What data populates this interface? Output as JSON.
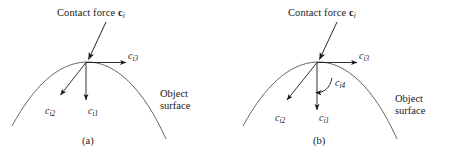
{
  "figure": {
    "background_color": "#ffffff",
    "stroke_color": "#1a1a1a",
    "curve_color": "#4a4a4a",
    "width": 463,
    "height": 159
  },
  "panels": [
    {
      "id": "a",
      "caption": "(a)",
      "title": {
        "prefix": "Contact force ",
        "vector": "c",
        "subscript": "i"
      },
      "surface_label": {
        "line1": "Object",
        "line2": "surface"
      },
      "vectors": [
        {
          "name": "normal-force",
          "symbol": "c",
          "subscript": "i1",
          "label": "c",
          "kind": "straight-arrow",
          "direction": "down"
        },
        {
          "name": "tangential-force-2",
          "symbol": "c",
          "subscript": "i2",
          "label": "c",
          "kind": "straight-arrow",
          "direction": "down-left"
        },
        {
          "name": "tangential-force-3",
          "symbol": "c",
          "subscript": "i3",
          "label": "c",
          "kind": "straight-arrow",
          "direction": "right"
        }
      ]
    },
    {
      "id": "b",
      "caption": "(b)",
      "title": {
        "prefix": "Contact force ",
        "vector": "c",
        "subscript": "i"
      },
      "surface_label": {
        "line1": "Object",
        "line2": "surface"
      },
      "vectors": [
        {
          "name": "normal-force",
          "symbol": "c",
          "subscript": "i1",
          "label": "c",
          "kind": "straight-arrow",
          "direction": "down"
        },
        {
          "name": "tangential-force-2",
          "symbol": "c",
          "subscript": "i2",
          "label": "c",
          "kind": "straight-arrow",
          "direction": "down-left"
        },
        {
          "name": "tangential-force-3",
          "symbol": "c",
          "subscript": "i3",
          "label": "c",
          "kind": "straight-arrow",
          "direction": "right"
        },
        {
          "name": "torsional-moment",
          "symbol": "c",
          "subscript": "i4",
          "label": "c",
          "kind": "curved-arrow",
          "direction": "counter-clockwise"
        }
      ]
    }
  ]
}
